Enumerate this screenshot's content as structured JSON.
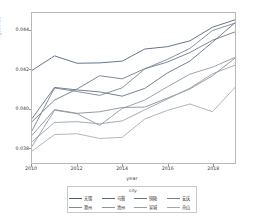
{
  "chart_data": {
    "type": "line",
    "title": "",
    "xlabel": "year",
    "ylabel": "m_score1",
    "xlim": [
      2010,
      2019
    ],
    "ylim": [
      0.0372,
      0.0449
    ],
    "xticks": [
      2010,
      2012,
      2014,
      2016,
      2018
    ],
    "xtick_labels": [
      "2010",
      "2012",
      "2014",
      "2016",
      "2018"
    ],
    "yticks": [
      0.038,
      0.04,
      0.042,
      0.044
    ],
    "ytick_labels": [
      "0.038",
      "0.040",
      "0.042",
      "0.044"
    ],
    "grid": false,
    "legend_position": "bottom",
    "legend_title": "city",
    "x": [
      2010,
      2011,
      2012,
      2013,
      2014,
      2015,
      2016,
      2017,
      2018,
      2019
    ],
    "series": [
      {
        "name": "无锡",
        "color": "#4c5c78",
        "values": [
          0.04195,
          0.0427,
          0.04232,
          0.04234,
          0.04243,
          0.04305,
          0.04317,
          0.04347,
          0.04417,
          0.04455
        ]
      },
      {
        "name": "马鞍",
        "color": "#5a6a80",
        "values": [
          0.03948,
          0.04108,
          0.04095,
          0.04085,
          0.04063,
          0.04103,
          0.04182,
          0.04243,
          0.0434,
          0.0444
        ]
      },
      {
        "name": "铜陵",
        "color": "#667585",
        "values": [
          0.03932,
          0.04043,
          0.041,
          0.04168,
          0.04152,
          0.04204,
          0.04238,
          0.04287,
          0.0435,
          0.04393
        ]
      },
      {
        "name": "安庆",
        "color": "#71808c",
        "values": [
          0.03886,
          0.04105,
          0.04087,
          0.04067,
          0.04106,
          0.04203,
          0.04252,
          0.04308,
          0.044,
          0.04438
        ]
      },
      {
        "name": "滁州",
        "color": "#7d8b94",
        "values": [
          0.03862,
          0.03994,
          0.03975,
          0.03983,
          0.04005,
          0.04007,
          0.04053,
          0.041,
          0.04168,
          0.04258
        ]
      },
      {
        "name": "池州",
        "color": "#8a959c",
        "values": [
          0.03805,
          0.03991,
          0.03973,
          0.03913,
          0.04,
          0.04043,
          0.04111,
          0.04176,
          0.04212,
          0.04262
        ]
      },
      {
        "name": "宣城",
        "color": "#959ea4",
        "values": [
          0.03829,
          0.03928,
          0.03932,
          0.03921,
          0.03936,
          0.03993,
          0.04048,
          0.04104,
          0.04178,
          0.04222
        ]
      },
      {
        "name": "舟山",
        "color": "#a0a8ad",
        "values": [
          0.03781,
          0.03866,
          0.0387,
          0.03846,
          0.03852,
          0.03946,
          0.0399,
          0.04023,
          0.03983,
          0.04108
        ]
      }
    ]
  }
}
